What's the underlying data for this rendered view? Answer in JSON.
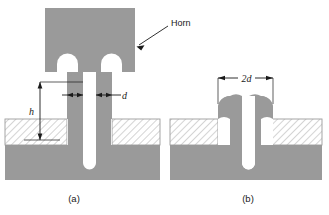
{
  "figure": {
    "captions": [
      {
        "id": "a",
        "text": "(a)"
      },
      {
        "id": "b",
        "text": "(b)"
      }
    ],
    "annotations": [
      {
        "id": "horn",
        "text": "Horn",
        "kind": "leader-label"
      },
      {
        "id": "h",
        "text": "h",
        "kind": "dimension-vertical"
      },
      {
        "id": "d",
        "text": "d",
        "kind": "dimension-horizontal"
      },
      {
        "id": "2d",
        "text": "2d",
        "kind": "dimension-horizontal"
      }
    ],
    "colors": {
      "metal_gray": "#9a9a9a",
      "hatch_line": "#a8a8a8",
      "hatch_fill": "#ffffff",
      "outline": "#808080",
      "text": "#1a1a1a",
      "background": "#ffffff"
    },
    "legend_notes": {
      "gray_region": "horn and substrate material",
      "hatched_region": "workpiece being joined",
      "white_region": "void / channel"
    }
  }
}
